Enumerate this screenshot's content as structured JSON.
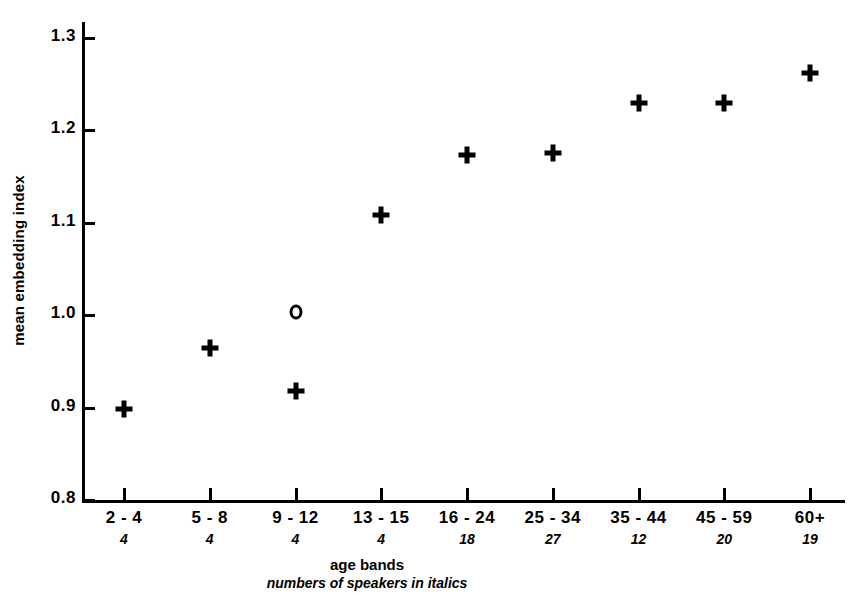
{
  "chart_data": {
    "type": "scatter",
    "title": "",
    "xlabel": "age bands",
    "xlabel_note": "numbers of speakers in italics",
    "ylabel": "mean embedding index",
    "ylim": [
      0.8,
      1.3
    ],
    "ytick_labels": [
      "1.3",
      "1.2",
      "1.1",
      "1.0",
      "0.9",
      "0.8"
    ],
    "ytick_values": [
      1.3,
      1.2,
      1.1,
      1.0,
      0.9,
      0.8
    ],
    "grid": false,
    "legend": "none",
    "categories": [
      "2 - 4",
      "5 - 8",
      "9 - 12",
      "13 - 15",
      "16 - 24",
      "25 - 34",
      "35 - 44",
      "45 - 59",
      "60+"
    ],
    "speaker_counts": [
      "4",
      "4",
      "4",
      "4",
      "18",
      "27",
      "12",
      "20",
      "19"
    ],
    "series": [
      {
        "name": "mean embedding index",
        "marker": "plus",
        "values": [
          0.898,
          0.965,
          0.918,
          1.108,
          1.173,
          1.176,
          1.23,
          1.23,
          1.262
        ]
      },
      {
        "name": "outlier",
        "marker": "circle",
        "points": [
          {
            "category": "9 - 12",
            "value": 1.003
          }
        ]
      }
    ]
  }
}
